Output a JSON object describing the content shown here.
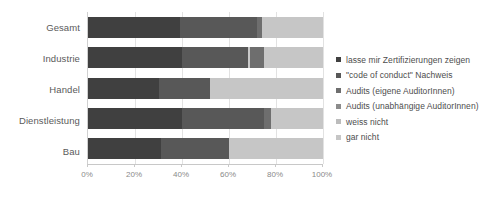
{
  "chart_data": {
    "type": "bar",
    "orientation": "horizontal",
    "stacked": "100%",
    "title": "",
    "subtitle": "",
    "xlabel": "",
    "ylabel": "",
    "xlim": [
      0,
      100
    ],
    "xticks": [
      0,
      20,
      40,
      60,
      80,
      100
    ],
    "xtick_labels": [
      "0%",
      "20%",
      "40%",
      "60%",
      "80%",
      "100%"
    ],
    "grid": true,
    "grid_axis": "x",
    "legend_position": "right",
    "categories": [
      "Gesamt",
      "Industrie",
      "Handel",
      "Dienstleistung",
      "Bau"
    ],
    "series": [
      {
        "name": "lasse mir Zertifizierungen zeigen",
        "color": "#404040",
        "values": [
          39,
          40,
          30,
          40,
          31
        ]
      },
      {
        "name": "\"code of conduct\" Nachweis",
        "color": "#585858",
        "values": [
          33,
          28,
          22,
          35,
          29
        ]
      },
      {
        "name": "Audits (eigene AuditorInnen)",
        "color": "#c9c9c9",
        "values": [
          0,
          1,
          0,
          0,
          0
        ]
      },
      {
        "name": "Audits (unabhängige AuditorInnen)",
        "color": "#6e6e6e",
        "values": [
          2,
          6,
          0,
          3,
          0
        ]
      },
      {
        "name": "weiss nicht",
        "color": "#d6d6d6",
        "values": [
          0,
          0,
          0,
          0,
          0
        ]
      },
      {
        "name": "gar nicht",
        "color": "#c6c6c6",
        "values": [
          26,
          25,
          48,
          22,
          40
        ]
      }
    ]
  },
  "legend": {
    "items": [
      {
        "label": "lasse mir Zertifizierungen zeigen",
        "color": "#404040"
      },
      {
        "label": "\"code of conduct\" Nachweis",
        "color": "#585858"
      },
      {
        "label": "Audits (eigene AuditorInnen)",
        "color": "#6e6e6e"
      },
      {
        "label": "Audits (unabhängige AuditorInnen)",
        "color": "#8c8c8c"
      },
      {
        "label": "weiss nicht",
        "color": "#bcbcbc"
      },
      {
        "label": "gar nicht",
        "color": "#c6c6c6"
      }
    ]
  },
  "axis": {
    "category_labels": [
      "Gesamt",
      "Industrie",
      "Handel",
      "Dienstleistung",
      "Bau"
    ],
    "tick_labels": [
      "0%",
      "20%",
      "40%",
      "60%",
      "80%",
      "100%"
    ]
  },
  "colors": {
    "background": "#ffffff",
    "gridline": "#e2e2e2",
    "axis_line": "#c8c8c8",
    "label_text": "#5a5a5a",
    "tick_text": "#8a8a8a",
    "legend_text": "#4d4d4d"
  }
}
